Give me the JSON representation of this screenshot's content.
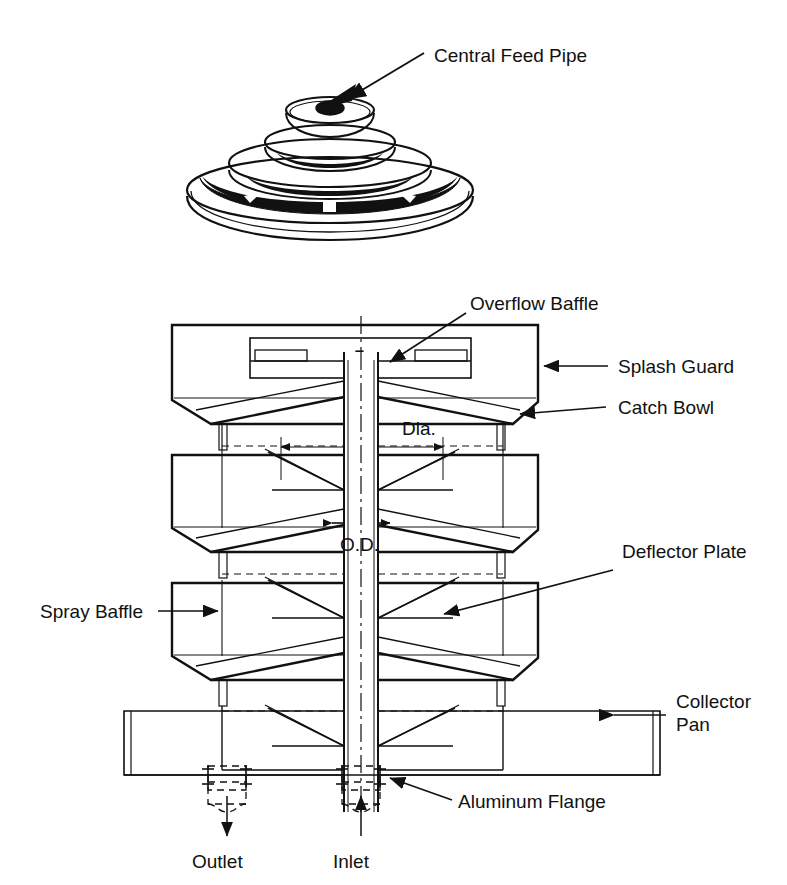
{
  "figure": {
    "title_visible": false,
    "background_color": "#ffffff",
    "line_color": "#000000",
    "type": "technical-line-drawing"
  },
  "views": {
    "isometric": {
      "name": "isometric-top-view",
      "callout": {
        "label": "Central Feed Pipe",
        "arrow_from": [
          430,
          50
        ],
        "arrow_to": [
          334,
          104
        ]
      }
    },
    "section": {
      "name": "vertical-cross-section",
      "stage_count": 3,
      "centerline": true
    }
  },
  "labels": {
    "central_feed_pipe": "Central Feed Pipe",
    "overflow_baffle": "Overflow Baffle",
    "splash_guard": "Splash Guard",
    "catch_bowl": "Catch Bowl",
    "deflector_plate": "Deflector Plate",
    "spray_baffle": "Spray Baffle",
    "collector_pan_line1": "Collector",
    "collector_pan_line2": "Pan",
    "aluminum_flange": "Aluminum Flange",
    "outlet": "Outlet",
    "inlet": "Inlet"
  },
  "dimensions": {
    "dia": "Dia.",
    "od": "O.D."
  },
  "callout_list": [
    {
      "name": "central-feed-pipe",
      "text": "Central Feed Pipe",
      "side": "right",
      "view": "isometric"
    },
    {
      "name": "overflow-baffle",
      "text": "Overflow Baffle",
      "side": "right",
      "view": "section"
    },
    {
      "name": "splash-guard",
      "text": "Splash Guard",
      "side": "right",
      "view": "section"
    },
    {
      "name": "catch-bowl",
      "text": "Catch Bowl",
      "side": "right",
      "view": "section"
    },
    {
      "name": "deflector-plate",
      "text": "Deflector Plate",
      "side": "right",
      "view": "section"
    },
    {
      "name": "collector-pan",
      "text": "Collector Pan",
      "side": "right",
      "view": "section"
    },
    {
      "name": "aluminum-flange",
      "text": "Aluminum Flange",
      "side": "right",
      "view": "section"
    },
    {
      "name": "spray-baffle",
      "text": "Spray Baffle",
      "side": "left",
      "view": "section"
    },
    {
      "name": "outlet",
      "text": "Outlet",
      "side": "bottom",
      "view": "section"
    },
    {
      "name": "inlet",
      "text": "Inlet",
      "side": "bottom",
      "view": "section"
    }
  ]
}
